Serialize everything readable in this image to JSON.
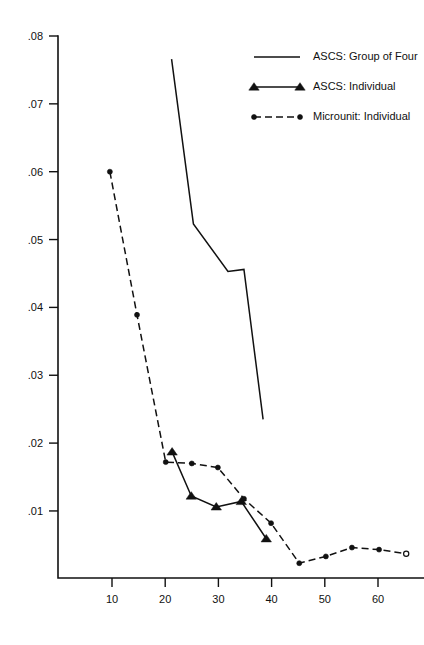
{
  "chart_data": {
    "type": "line",
    "title": "",
    "subtitle": "",
    "xlabel": "",
    "ylabel": "",
    "xlim": [
      0,
      68
    ],
    "ylim": [
      0,
      0.08
    ],
    "grid": false,
    "legend_position": "top-right",
    "x_ticks": [
      "10",
      "20",
      "30",
      "40",
      "50",
      "60"
    ],
    "x_tick_values": [
      10,
      20,
      30,
      40,
      50,
      60
    ],
    "y_ticks": [
      ".01",
      ".02",
      ".03",
      ".04",
      ".05",
      ".06",
      ".07",
      ".08"
    ],
    "y_tick_values": [
      0.01,
      0.02,
      0.03,
      0.04,
      0.05,
      0.06,
      0.07,
      0.08
    ],
    "series": [
      {
        "name": "ASCS:  Group of Four",
        "style": "solid",
        "marker": "none",
        "x": [
          21.2,
          25.3,
          31.8,
          34.8,
          38.4
        ],
        "values": [
          0.0766,
          0.0523,
          0.0453,
          0.0456,
          0.0235
        ]
      },
      {
        "name": "ASCS:  Individual",
        "style": "solid",
        "marker": "triangle",
        "x": [
          21.3,
          24.9,
          29.6,
          34.3,
          39.0
        ],
        "values": [
          0.0187,
          0.0122,
          0.0106,
          0.0114,
          0.0059
        ]
      },
      {
        "name": "Microunit:  Individual",
        "style": "dashed",
        "marker": "dot",
        "x": [
          9.6,
          14.7,
          20.1,
          25.0,
          29.9,
          34.8,
          39.9,
          45.2,
          50.2,
          55.1,
          60.2,
          65.3
        ],
        "values": [
          0.06,
          0.0389,
          0.0172,
          0.017,
          0.0164,
          0.0118,
          0.0082,
          0.0023,
          0.0033,
          0.0046,
          0.0043,
          0.0037
        ],
        "last_marker": "open-circle"
      }
    ],
    "legend": [
      {
        "label": "ASCS:  Group of Four",
        "style": "solid",
        "marker": "none"
      },
      {
        "label": "ASCS:  Individual",
        "style": "solid",
        "marker": "triangle"
      },
      {
        "label": "Microunit:  Individual",
        "style": "dashed",
        "marker": "dot"
      }
    ]
  }
}
